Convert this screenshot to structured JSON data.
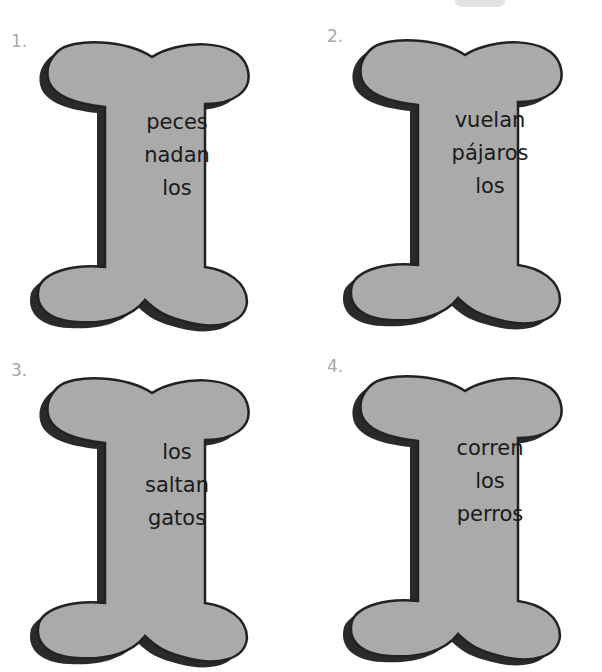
{
  "worksheet": {
    "colors": {
      "bone_fill": "#aaaaaa",
      "bone_outline": "#222222",
      "bone_shadow": "#2a2a2a",
      "number_color": "#a8a8a8",
      "text_color": "#1a1a1a"
    },
    "items": [
      {
        "number": "1.",
        "words": [
          "peces",
          "nadan",
          "los"
        ]
      },
      {
        "number": "2.",
        "words": [
          "vuelan",
          "pájaros",
          "los"
        ]
      },
      {
        "number": "3.",
        "words": [
          "los",
          "saltan",
          "gatos"
        ]
      },
      {
        "number": "4.",
        "words": [
          "corren",
          "los",
          "perros"
        ]
      }
    ]
  }
}
